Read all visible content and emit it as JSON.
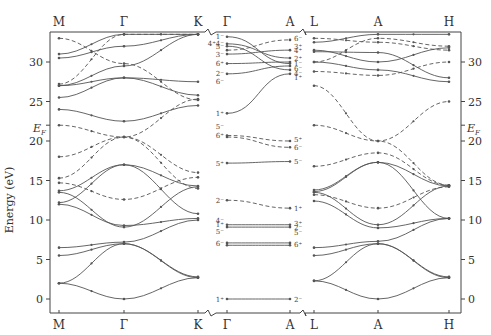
{
  "diagram": {
    "type": "band-structure",
    "ylabel": "Energy (eV)",
    "fermi_label": "E",
    "fermi_sub": "F",
    "fermi_energy": 22,
    "ylim": [
      -1,
      33.5
    ],
    "yticks": [
      0,
      5,
      10,
      15,
      20,
      25,
      30
    ],
    "panels": [
      {
        "points": [
          "M",
          "Γ",
          "K"
        ]
      },
      {
        "points": [
          "Γ",
          "A"
        ]
      },
      {
        "points": [
          "L",
          "A",
          "H"
        ]
      }
    ],
    "gamma_labels_left": [
      "1⁻",
      "4⁺4⁻",
      "5⁻",
      "3⁻",
      "6⁺",
      "2⁻",
      "6⁻",
      "1⁺",
      "5⁻",
      "6⁺",
      "5⁺",
      "2⁻",
      "4⁻",
      "1⁺",
      "5⁻",
      "6⁻",
      "1⁺"
    ],
    "a_labels_right": [
      "6⁻",
      "3⁺",
      "4⁺",
      "2⁺",
      "1⁻",
      "6⁻",
      "4⁻",
      "1⁺",
      "5⁺",
      "6⁻",
      "5⁻",
      "1⁺",
      "3⁺",
      "2⁻",
      "5⁻",
      "6⁺",
      "2⁻"
    ]
  },
  "chart_data": {
    "type": "line",
    "title": "",
    "xlabel": "",
    "ylabel": "Energy (eV)",
    "ylim": [
      -1,
      33.5
    ],
    "series_note": "solid = bands, dashed = other symmetry bands",
    "panel1_MGK": [
      {
        "style": "solid",
        "M": 2,
        "G": 0,
        "K": 2.7
      },
      {
        "style": "solid",
        "M": 2,
        "G": 7,
        "K": 2.7
      },
      {
        "style": "solid",
        "M": 5.5,
        "G": 7,
        "K": 2.8
      },
      {
        "style": "solid",
        "M": 6.5,
        "G": 7.2,
        "K": 10
      },
      {
        "style": "solid",
        "M": 12,
        "G": 9.3,
        "K": 10.2
      },
      {
        "style": "solid",
        "M": 13.5,
        "G": 9.1,
        "K": 14.2
      },
      {
        "style": "solid",
        "M": 13.7,
        "G": 17,
        "K": 10.8
      },
      {
        "style": "solid",
        "M": 12.2,
        "G": 17,
        "K": 14.3
      },
      {
        "style": "dashed",
        "M": 14.7,
        "G": 12.6,
        "K": 15.4
      },
      {
        "style": "dashed",
        "M": 15.3,
        "G": 20.5,
        "K": 16
      },
      {
        "style": "dashed",
        "M": 18,
        "G": 20.5,
        "K": 25.3
      },
      {
        "style": "dashed",
        "M": 22,
        "G": 20.5,
        "K": 14
      },
      {
        "style": "solid",
        "M": 24,
        "G": 22.5,
        "K": 24.5
      },
      {
        "style": "solid",
        "M": 25.5,
        "G": 28,
        "K": 25.8
      },
      {
        "style": "solid",
        "M": 27,
        "G": 28,
        "K": 27.5
      },
      {
        "style": "solid",
        "M": 27,
        "G": 29.5,
        "K": 33.5
      },
      {
        "style": "solid",
        "M": 30.5,
        "G": 32,
        "K": 33.5
      },
      {
        "style": "solid",
        "M": 31,
        "G": 33.5,
        "K": 33.5
      },
      {
        "style": "dashed",
        "M": 27.2,
        "G": 33.5,
        "K": 33.5
      },
      {
        "style": "dashed",
        "M": 33,
        "G": 29.8,
        "K": 25.2
      }
    ],
    "panel2_GA": [
      {
        "style": "solid",
        "G": 0,
        "A": 0
      },
      {
        "style": "solid",
        "G": 6.8,
        "A": 6.8
      },
      {
        "style": "solid",
        "G": 7.1,
        "A": 7.1
      },
      {
        "style": "solid",
        "G": 9.1,
        "A": 9.1
      },
      {
        "style": "solid",
        "G": 9.4,
        "A": 9.4
      },
      {
        "style": "dashed",
        "G": 12.5,
        "A": 11.5
      },
      {
        "style": "solid",
        "G": 17.2,
        "A": 17.4
      },
      {
        "style": "dashed",
        "G": 20.5,
        "A": 19.2
      },
      {
        "style": "dashed",
        "G": 20.7,
        "A": 20
      },
      {
        "style": "solid",
        "G": 23.5,
        "A": 28.5
      },
      {
        "style": "solid",
        "G": 28.5,
        "A": 29.5
      },
      {
        "style": "solid",
        "G": 29.8,
        "A": 30
      },
      {
        "style": "solid",
        "G": 31,
        "A": 31.5
      },
      {
        "style": "solid",
        "G": 32,
        "A": 29
      },
      {
        "style": "solid",
        "G": 32.3,
        "A": 30.5
      },
      {
        "style": "solid",
        "G": 33.2,
        "A": 29.8
      },
      {
        "style": "dashed",
        "G": 31.5,
        "A": 32.8
      }
    ],
    "panel3_LAH": [
      {
        "style": "solid",
        "L": 2.3,
        "A": 0,
        "H": 2.7
      },
      {
        "style": "solid",
        "L": 2.3,
        "A": 7,
        "H": 2.7
      },
      {
        "style": "solid",
        "L": 5.5,
        "A": 7,
        "H": 2.8
      },
      {
        "style": "solid",
        "L": 6.5,
        "A": 7.3,
        "H": 10.2
      },
      {
        "style": "solid",
        "L": 12.4,
        "A": 9,
        "H": 10.2
      },
      {
        "style": "solid",
        "L": 13.5,
        "A": 9.4,
        "H": 14.3
      },
      {
        "style": "solid",
        "L": 13.8,
        "A": 17.3,
        "H": 10.2
      },
      {
        "style": "solid",
        "L": 13.6,
        "A": 17.3,
        "H": 14.3
      },
      {
        "style": "dashed",
        "L": 13.2,
        "A": 11.5,
        "H": 14.2
      },
      {
        "style": "dashed",
        "L": 16.8,
        "A": 18.5,
        "H": 14.4
      },
      {
        "style": "dashed",
        "L": 22,
        "A": 20,
        "H": 25
      },
      {
        "style": "dashed",
        "L": 27,
        "A": 20,
        "H": 14.4
      },
      {
        "style": "dashed",
        "L": 28.8,
        "A": 28.3,
        "H": 30
      },
      {
        "style": "solid",
        "L": 30,
        "A": 29,
        "H": 27.5
      },
      {
        "style": "solid",
        "L": 31.3,
        "A": 31.2,
        "H": 28
      },
      {
        "style": "solid",
        "L": 31.5,
        "A": 30,
        "H": 31.8
      },
      {
        "style": "solid",
        "L": 32.5,
        "A": 33.5,
        "H": 33.5
      },
      {
        "style": "dashed",
        "L": 33,
        "A": 32.5,
        "H": 31.5
      },
      {
        "style": "dashed",
        "L": 30,
        "A": 33,
        "H": 32
      }
    ]
  }
}
